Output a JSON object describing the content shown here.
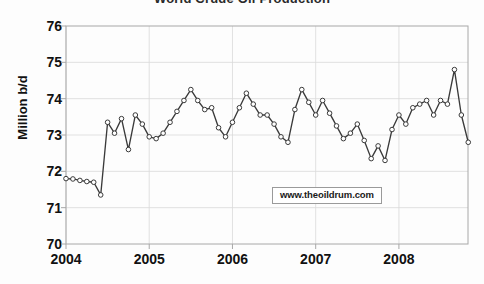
{
  "chart_data": {
    "type": "line",
    "title": "World Crude Oil Production",
    "xlabel": "",
    "ylabel": "Million b/d",
    "ylim": [
      70,
      76
    ],
    "xlim": [
      2004.0,
      2008.83
    ],
    "ytick_labels": [
      "76",
      "75",
      "74",
      "73",
      "72",
      "71",
      "70"
    ],
    "ytick_values": [
      76,
      75,
      74,
      73,
      72,
      71,
      70
    ],
    "xtick_labels": [
      "2004",
      "2005",
      "2006",
      "2007",
      "2008"
    ],
    "xtick_values": [
      2004,
      2005,
      2006,
      2007,
      2008
    ],
    "grid": true,
    "legend": "none",
    "markers": "open-circle",
    "line_color": "#3a3a3a",
    "marker_fill": "#ffffff",
    "grid_color": "#d9d9d9",
    "axis_color": "#a8a8a8",
    "annotation": "www.theoildrum.com",
    "series": [
      {
        "name": "World Crude Oil Production",
        "x": [
          2004.0,
          2004.083,
          2004.167,
          2004.25,
          2004.333,
          2004.417,
          2004.5,
          2004.583,
          2004.667,
          2004.75,
          2004.833,
          2004.917,
          2005.0,
          2005.083,
          2005.167,
          2005.25,
          2005.333,
          2005.417,
          2005.5,
          2005.583,
          2005.667,
          2005.75,
          2005.833,
          2005.917,
          2006.0,
          2006.083,
          2006.167,
          2006.25,
          2006.333,
          2006.417,
          2006.5,
          2006.583,
          2006.667,
          2006.75,
          2006.833,
          2006.917,
          2007.0,
          2007.083,
          2007.167,
          2007.25,
          2007.333,
          2007.417,
          2007.5,
          2007.583,
          2007.667,
          2007.75,
          2007.833,
          2007.917,
          2008.0,
          2008.083,
          2008.167,
          2008.25,
          2008.333,
          2008.417,
          2008.5,
          2008.583,
          2008.667,
          2008.75,
          2008.833
        ],
        "values": [
          71.8,
          71.79,
          71.75,
          71.72,
          71.7,
          71.35,
          73.35,
          73.05,
          73.45,
          72.6,
          73.55,
          73.3,
          72.95,
          72.9,
          73.05,
          73.35,
          73.65,
          73.95,
          74.25,
          73.95,
          73.7,
          73.75,
          73.2,
          72.95,
          73.35,
          73.75,
          74.15,
          73.85,
          73.55,
          73.55,
          73.3,
          72.95,
          72.8,
          73.7,
          74.25,
          73.9,
          73.55,
          73.95,
          73.6,
          73.25,
          72.9,
          73.05,
          73.3,
          72.85,
          72.35,
          72.7,
          72.3,
          73.15,
          73.55,
          73.3,
          73.75,
          73.85,
          73.95,
          73.55,
          73.95,
          73.85,
          74.8,
          73.55,
          72.8
        ]
      }
    ]
  },
  "axes": {
    "ylabel": "Million b/d"
  },
  "watermark": {
    "text": "www.theoildrum.com"
  }
}
